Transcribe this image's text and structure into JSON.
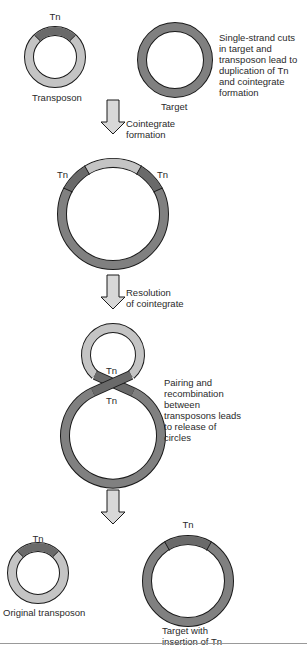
{
  "colors": {
    "target_ring": "#808080",
    "transposon_ring": "#c4c4c4",
    "tn_segment": "#6a6a6a",
    "arrow_fill": "#d8d8d8",
    "outline": "#1a1a1a"
  },
  "step1": {
    "transposon_tn_label": "Tn",
    "transposon_label": "Transposon",
    "target_label": "Target",
    "note": "Single-strand cuts\nin target and\ntransposon lead to\nduplication of Tn\nand cointegrate\nformation"
  },
  "arrow1": {
    "label": "Cointegrate\nformation"
  },
  "step2": {
    "tn_left": "Tn",
    "tn_right": "Tn"
  },
  "arrow2": {
    "label": "Resolution\nof cointegrate"
  },
  "step3": {
    "tn_upper": "Tn",
    "tn_lower": "Tn",
    "note": "Pairing and\nrecombination\nbetween\ntransposons leads\nto release of\ncircles"
  },
  "step4": {
    "original_tn_label": "Tn",
    "original_label": "Original transposon",
    "target_tn_label": "Tn",
    "target_label": "Target with\ninsertion of Tn"
  }
}
